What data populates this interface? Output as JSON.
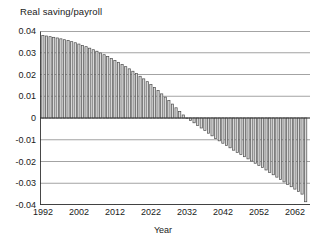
{
  "chart_data": {
    "type": "bar",
    "title": "Real saving/payroll",
    "xlabel": "Year",
    "ylabel": "",
    "ylim": [
      -0.04,
      0.04
    ],
    "xlim": [
      1991.2,
      2066.2
    ],
    "grid": true,
    "legend": null,
    "ytick_labels": [
      "0.04",
      "0.03",
      "0.02",
      "0.01",
      "0",
      "-0.01",
      "-0.02",
      "-0.03",
      "-0.04"
    ],
    "ytick_values": [
      0.04,
      0.03,
      0.02,
      0.01,
      0,
      -0.01,
      -0.02,
      -0.03,
      -0.04
    ],
    "xtick_labels": [
      "1992",
      "2002",
      "2012",
      "2022",
      "2032",
      "2042",
      "2052",
      "2062"
    ],
    "xtick_values": [
      1992,
      2002,
      2012,
      2022,
      2032,
      2042,
      2052,
      2062
    ],
    "bar_face_color": "#d9d9d9",
    "bar_edge_color": "#4d4d4d",
    "grid_color": "#999999",
    "axis_color": "#333333",
    "categories": [
      1992,
      1993,
      1994,
      1995,
      1996,
      1997,
      1998,
      1999,
      2000,
      2001,
      2002,
      2003,
      2004,
      2005,
      2006,
      2007,
      2008,
      2009,
      2010,
      2011,
      2012,
      2013,
      2014,
      2015,
      2016,
      2017,
      2018,
      2019,
      2020,
      2021,
      2022,
      2023,
      2024,
      2025,
      2026,
      2027,
      2028,
      2029,
      2030,
      2031,
      2032,
      2033,
      2034,
      2035,
      2036,
      2037,
      2038,
      2039,
      2040,
      2041,
      2042,
      2043,
      2044,
      2045,
      2046,
      2047,
      2048,
      2049,
      2050,
      2051,
      2052,
      2053,
      2054,
      2055,
      2056,
      2057,
      2058,
      2059,
      2060,
      2061,
      2062,
      2063,
      2064,
      2065
    ],
    "values": [
      0.038,
      0.0377,
      0.0374,
      0.0371,
      0.0368,
      0.0364,
      0.036,
      0.0356,
      0.0351,
      0.0346,
      0.034,
      0.0334,
      0.0328,
      0.0321,
      0.0314,
      0.0307,
      0.0299,
      0.0291,
      0.0283,
      0.0274,
      0.0265,
      0.0256,
      0.0246,
      0.0236,
      0.0226,
      0.0215,
      0.0204,
      0.0192,
      0.018,
      0.0167,
      0.0154,
      0.014,
      0.0126,
      0.0111,
      0.0096,
      0.008,
      0.0064,
      0.0047,
      0.003,
      0.0014,
      -0.0002,
      -0.0012,
      -0.0022,
      -0.0034,
      -0.0046,
      -0.0058,
      -0.007,
      -0.0082,
      -0.0094,
      -0.0105,
      -0.0116,
      -0.0127,
      -0.0137,
      -0.0148,
      -0.0158,
      -0.0168,
      -0.0178,
      -0.0188,
      -0.0198,
      -0.0208,
      -0.0218,
      -0.0228,
      -0.0239,
      -0.025,
      -0.0261,
      -0.0272,
      -0.0283,
      -0.0294,
      -0.0305,
      -0.0316,
      -0.0327,
      -0.0338,
      -0.035,
      -0.0385
    ]
  }
}
